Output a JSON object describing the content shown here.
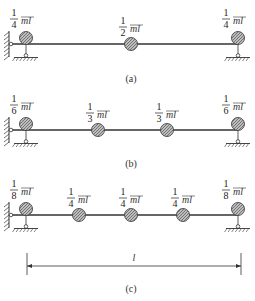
{
  "figures": [
    {
      "id": "a",
      "caption": "(a)",
      "beam_y": 44,
      "caption_y": 82,
      "masses": [
        {
          "x": 26,
          "num": "1",
          "den": "4",
          "unit": "ml",
          "label": "1/4 ml"
        },
        {
          "x": 131,
          "num": "1",
          "den": "2",
          "unit": "ml",
          "label": "1/2 ml"
        },
        {
          "x": 238,
          "num": "1",
          "den": "4",
          "unit": "ml",
          "label": "1/4 ml"
        }
      ]
    },
    {
      "id": "b",
      "caption": "(b)",
      "beam_y": 130,
      "caption_y": 167,
      "masses": [
        {
          "x": 26,
          "num": "1",
          "den": "6",
          "unit": "ml",
          "label": "1/6 ml"
        },
        {
          "x": 98,
          "num": "1",
          "den": "3",
          "unit": "ml",
          "label": "1/3 ml"
        },
        {
          "x": 167,
          "num": "1",
          "den": "3",
          "unit": "ml",
          "label": "1/3 ml"
        },
        {
          "x": 238,
          "num": "1",
          "den": "6",
          "unit": "ml",
          "label": "1/6 ml"
        }
      ]
    },
    {
      "id": "c",
      "caption": "(c)",
      "beam_y": 215,
      "caption_y": 292,
      "masses": [
        {
          "x": 26,
          "num": "1",
          "den": "8",
          "unit": "ml",
          "label": "1/8 ml"
        },
        {
          "x": 79,
          "num": "1",
          "den": "4",
          "unit": "ml",
          "label": "1/4 ml"
        },
        {
          "x": 131,
          "num": "1",
          "den": "4",
          "unit": "ml",
          "label": "1/4 ml"
        },
        {
          "x": 183,
          "num": "1",
          "den": "4",
          "unit": "ml",
          "label": "1/4 ml"
        },
        {
          "x": 238,
          "num": "1",
          "den": "8",
          "unit": "ml",
          "label": "1/8 ml"
        }
      ]
    }
  ],
  "dimension": {
    "label": "l",
    "x1": 27,
    "x2": 241,
    "y": 266
  },
  "colors": {
    "line": "#333333",
    "mass_fill": "#9a9a9a",
    "mass_stroke": "#444444"
  }
}
